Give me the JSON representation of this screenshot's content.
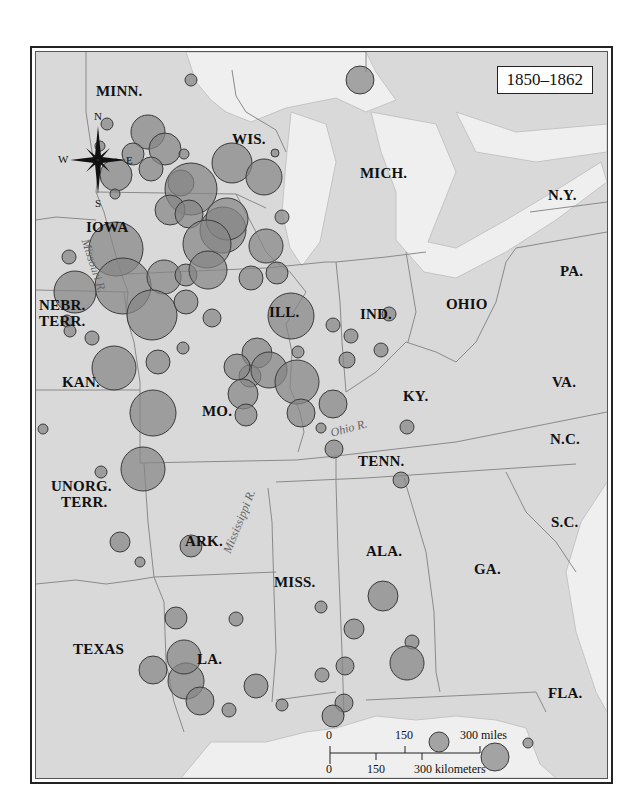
{
  "title": "1850–1862",
  "states": [
    {
      "id": "minn",
      "label": "MINN.",
      "x": 60,
      "y": 32
    },
    {
      "id": "wis",
      "label": "WIS.",
      "x": 196,
      "y": 80
    },
    {
      "id": "mich",
      "label": "MICH.",
      "x": 324,
      "y": 114
    },
    {
      "id": "ny",
      "label": "N.Y.",
      "x": 512,
      "y": 136
    },
    {
      "id": "iowa",
      "label": "IOWA",
      "x": 50,
      "y": 168
    },
    {
      "id": "pa",
      "label": "PA.",
      "x": 524,
      "y": 212
    },
    {
      "id": "nebr",
      "label": "NEBR.",
      "x": 3,
      "y": 246
    },
    {
      "id": "terr1",
      "label": "TERR.",
      "x": 3,
      "y": 262
    },
    {
      "id": "ill",
      "label": "ILL.",
      "x": 233,
      "y": 253
    },
    {
      "id": "ind",
      "label": "IND.",
      "x": 324,
      "y": 255
    },
    {
      "id": "ohio",
      "label": "OHIO",
      "x": 410,
      "y": 245
    },
    {
      "id": "kan",
      "label": "KAN.",
      "x": 26,
      "y": 323
    },
    {
      "id": "va",
      "label": "VA.",
      "x": 516,
      "y": 323
    },
    {
      "id": "mo",
      "label": "MO.",
      "x": 166,
      "y": 352
    },
    {
      "id": "ky",
      "label": "KY.",
      "x": 367,
      "y": 337
    },
    {
      "id": "nc",
      "label": "N.C.",
      "x": 514,
      "y": 380
    },
    {
      "id": "tenn",
      "label": "TENN.",
      "x": 322,
      "y": 402
    },
    {
      "id": "unorg",
      "label": "UNORG.",
      "x": 15,
      "y": 427
    },
    {
      "id": "terr2",
      "label": "TERR.",
      "x": 25,
      "y": 443
    },
    {
      "id": "sc",
      "label": "S.C.",
      "x": 515,
      "y": 463
    },
    {
      "id": "ark",
      "label": "ARK.",
      "x": 149,
      "y": 482
    },
    {
      "id": "ala",
      "label": "ALA.",
      "x": 330,
      "y": 492
    },
    {
      "id": "ga",
      "label": "GA.",
      "x": 438,
      "y": 510
    },
    {
      "id": "miss",
      "label": "MISS.",
      "x": 238,
      "y": 523
    },
    {
      "id": "texas",
      "label": "TEXAS",
      "x": 37,
      "y": 590
    },
    {
      "id": "la",
      "label": "LA.",
      "x": 161,
      "y": 600
    },
    {
      "id": "fla",
      "label": "FLA.",
      "x": 512,
      "y": 634
    }
  ],
  "rivers": [
    {
      "id": "missouri",
      "label": "Missouri R.",
      "x": 56,
      "y": 185,
      "rotate": 72
    },
    {
      "id": "ohio",
      "label": "Ohio R.",
      "x": 293,
      "y": 374,
      "rotate": -15
    },
    {
      "id": "mississippi",
      "label": "Mississippi R.",
      "x": 184,
      "y": 498,
      "rotate": -68
    }
  ],
  "compass": {
    "n": "N",
    "s": "S",
    "e": "E",
    "w": "W"
  },
  "scale": {
    "miles_labels": [
      "0",
      "150",
      "300 miles"
    ],
    "km_labels": [
      "0",
      "150",
      "300 kilometers"
    ]
  },
  "circles": [
    [
      357,
      34,
      14
    ],
    [
      188,
      34,
      6
    ],
    [
      104,
      78,
      6
    ],
    [
      97,
      100,
      5
    ],
    [
      145,
      86,
      17
    ],
    [
      130,
      108,
      11
    ],
    [
      162,
      103,
      16
    ],
    [
      181,
      108,
      5
    ],
    [
      113,
      129,
      16
    ],
    [
      148,
      123,
      12
    ],
    [
      178,
      137,
      13
    ],
    [
      229,
      117,
      20
    ],
    [
      261,
      131,
      18
    ],
    [
      272,
      107,
      4
    ],
    [
      112,
      148,
      5
    ],
    [
      188,
      143,
      26
    ],
    [
      167,
      164,
      15
    ],
    [
      186,
      168,
      14
    ],
    [
      220,
      184,
      23
    ],
    [
      224,
      173,
      21
    ],
    [
      279,
      171,
      7
    ],
    [
      204,
      198,
      24
    ],
    [
      263,
      200,
      17
    ],
    [
      274,
      227,
      11
    ],
    [
      113,
      203,
      27
    ],
    [
      120,
      240,
      28
    ],
    [
      72,
      246,
      21
    ],
    [
      161,
      231,
      17
    ],
    [
      183,
      229,
      11
    ],
    [
      149,
      269,
      25
    ],
    [
      205,
      224,
      19
    ],
    [
      66,
      211,
      7
    ],
    [
      64,
      275,
      6
    ],
    [
      67,
      285,
      6
    ],
    [
      180,
      302,
      6
    ],
    [
      183,
      256,
      12
    ],
    [
      209,
      272,
      9
    ],
    [
      248,
      232,
      12
    ],
    [
      111,
      322,
      22
    ],
    [
      155,
      316,
      12
    ],
    [
      89,
      292,
      7
    ],
    [
      254,
      307,
      15
    ],
    [
      247,
      330,
      11
    ],
    [
      234,
      321,
      13
    ],
    [
      266,
      324,
      18
    ],
    [
      240,
      348,
      15
    ],
    [
      243,
      369,
      11
    ],
    [
      294,
      336,
      22
    ],
    [
      288,
      270,
      23
    ],
    [
      295,
      306,
      6
    ],
    [
      344,
      314,
      8
    ],
    [
      330,
      358,
      14
    ],
    [
      298,
      367,
      14
    ],
    [
      150,
      367,
      23
    ],
    [
      140,
      423,
      22
    ],
    [
      318,
      382,
      5
    ],
    [
      40,
      383,
      5
    ],
    [
      98,
      426,
      6
    ],
    [
      330,
      279,
      7
    ],
    [
      348,
      290,
      7
    ],
    [
      331,
      403,
      9
    ],
    [
      386,
      268,
      7
    ],
    [
      404,
      381,
      7
    ],
    [
      378,
      304,
      7
    ],
    [
      398,
      434,
      8
    ],
    [
      117,
      496,
      10
    ],
    [
      188,
      500,
      11
    ],
    [
      137,
      516,
      5
    ],
    [
      173,
      572,
      11
    ],
    [
      183,
      635,
      18
    ],
    [
      150,
      624,
      14
    ],
    [
      181,
      611,
      17
    ],
    [
      197,
      655,
      14
    ],
    [
      220,
      745,
      10
    ],
    [
      253,
      640,
      12
    ],
    [
      226,
      664,
      7
    ],
    [
      233,
      573,
      7
    ],
    [
      279,
      659,
      6
    ],
    [
      318,
      561,
      6
    ],
    [
      351,
      583,
      10
    ],
    [
      380,
      550,
      15
    ],
    [
      319,
      629,
      7
    ],
    [
      342,
      620,
      9
    ],
    [
      409,
      596,
      7
    ],
    [
      404,
      617,
      17
    ],
    [
      341,
      657,
      9
    ],
    [
      330,
      670,
      11
    ],
    [
      436,
      696,
      10
    ],
    [
      492,
      711,
      14
    ],
    [
      525,
      697,
      5
    ],
    [
      503,
      745,
      5
    ]
  ],
  "colors": {
    "land": "#d9d9d9",
    "water": "#efefef",
    "circle_fill": "#858585",
    "circle_stroke": "#3a3a3a",
    "border": "#8a8a8a"
  }
}
